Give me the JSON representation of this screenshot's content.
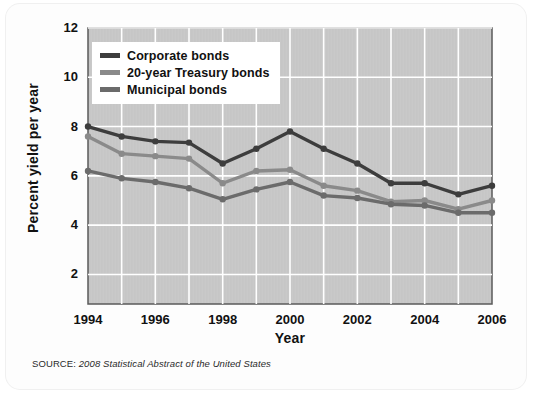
{
  "chart_data": {
    "type": "line",
    "title": "",
    "subtitle": "",
    "xlabel": "Year",
    "ylabel": "Percent yield per year",
    "x": [
      1994,
      1995,
      1996,
      1997,
      1998,
      1999,
      2000,
      2001,
      2002,
      2003,
      2004,
      2005,
      2006
    ],
    "xlim": [
      1994,
      2006
    ],
    "ylim": [
      0.8,
      12
    ],
    "xticks": [
      1994,
      1996,
      1998,
      2000,
      2002,
      2004,
      2006
    ],
    "xtick_labels": [
      "1994",
      "1996",
      "1998",
      "2000",
      "2002",
      "2004",
      "2006"
    ],
    "yticks": [
      2,
      4,
      6,
      8,
      10,
      12
    ],
    "ytick_labels": [
      "2",
      "4",
      "6",
      "8",
      "10",
      "12"
    ],
    "grid": true,
    "grid_color": "#ffffff",
    "plot_bg": "#c9c9c9",
    "legend_position": "upper-left",
    "series": [
      {
        "name": "Corporate bonds",
        "color": "#3d3d3d",
        "values": [
          8.0,
          7.6,
          7.4,
          7.35,
          6.5,
          7.1,
          7.8,
          7.1,
          6.5,
          5.7,
          5.7,
          5.25,
          5.6
        ]
      },
      {
        "name": "20-year Treasury bonds",
        "color": "#8a8a8a",
        "values": [
          7.6,
          6.9,
          6.8,
          6.7,
          5.7,
          6.2,
          6.25,
          5.6,
          5.4,
          4.95,
          5.0,
          4.65,
          5.0
        ]
      },
      {
        "name": "Municipal bonds",
        "color": "#6b6b6b",
        "values": [
          6.2,
          5.9,
          5.75,
          5.5,
          5.05,
          5.45,
          5.75,
          5.2,
          5.1,
          4.85,
          4.8,
          4.5,
          4.5
        ]
      }
    ],
    "annotations": []
  },
  "source": {
    "label": "SOURCE: ",
    "title": "2008 Statistical Abstract of the United States"
  },
  "legend": {
    "items": [
      {
        "label": "Corporate bonds"
      },
      {
        "label": "20-year Treasury bonds"
      },
      {
        "label": "Municipal bonds"
      }
    ]
  }
}
